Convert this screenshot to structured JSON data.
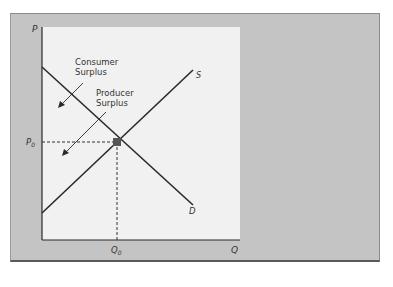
{
  "diagram": {
    "axes": {
      "y_label": "P",
      "x_label": "Q"
    },
    "curves": [
      {
        "id": "supply",
        "label": "S"
      },
      {
        "id": "demand",
        "label": "D"
      }
    ],
    "equilibrium": {
      "price_label": "P",
      "price_sub": "0",
      "quantity_label": "Q",
      "quantity_sub": "0"
    },
    "annotations": [
      {
        "id": "consumer-surplus",
        "line1": "Consumer",
        "line2": "Surplus"
      },
      {
        "id": "producer-surplus",
        "line1": "Producer",
        "line2": "Surplus"
      }
    ],
    "colors": {
      "frame": "#c4c4c4",
      "plot_background": "#f1f1f1",
      "line": "#2a2a2a",
      "equilibrium_point": "#555555"
    }
  }
}
